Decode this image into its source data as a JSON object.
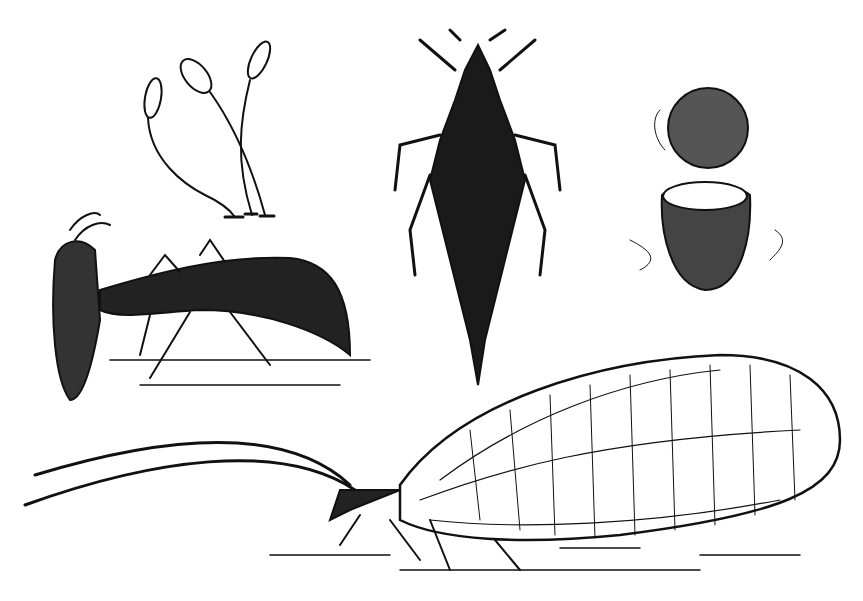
{
  "image": {
    "description": "Black-and-white engraving of lacewing life stages",
    "background": "#ffffff",
    "ink": "#111111",
    "figures": [
      {
        "name": "stalked-eggs",
        "label": ""
      },
      {
        "name": "larva-feeding-side-view",
        "label": ""
      },
      {
        "name": "larva-dorsal-view",
        "label": ""
      },
      {
        "name": "cocoon-opened",
        "label": ""
      },
      {
        "name": "adult-lacewing",
        "label": ""
      }
    ]
  }
}
